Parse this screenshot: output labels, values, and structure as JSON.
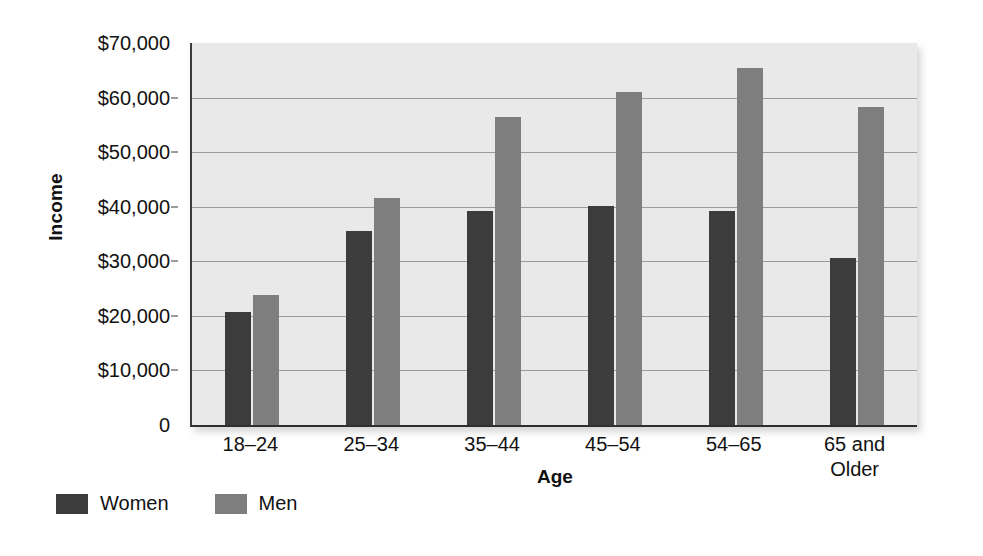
{
  "chart_data": {
    "type": "bar",
    "title": "",
    "xlabel": "Age",
    "ylabel": "Income",
    "categories": [
      "18–24",
      "25–34",
      "35–44",
      "45–54",
      "54–65",
      "65 and\nOlder"
    ],
    "series": [
      {
        "name": "Women",
        "color": "#3c3c3c",
        "values": [
          20700,
          35500,
          39200,
          40100,
          39200,
          30600
        ]
      },
      {
        "name": "Men",
        "color": "#7e7e7e",
        "values": [
          23800,
          41600,
          56400,
          61000,
          65500,
          58200
        ]
      }
    ],
    "ylim": [
      0,
      70000
    ],
    "ytick_values": [
      0,
      10000,
      20000,
      30000,
      40000,
      50000,
      60000,
      70000
    ],
    "ytick_labels": [
      "0",
      "$10,000",
      "$20,000",
      "$30,000",
      "$40,000",
      "$50,000",
      "$60,000",
      "$70,000"
    ],
    "gridlines_at": [
      10000,
      20000,
      30000,
      40000,
      50000,
      60000
    ],
    "grid": true,
    "legend_position": "bottom-left",
    "plot_background": "#e9e9e9",
    "grid_color": "#9a9a9a",
    "axis_color": "#3b3b3b"
  }
}
